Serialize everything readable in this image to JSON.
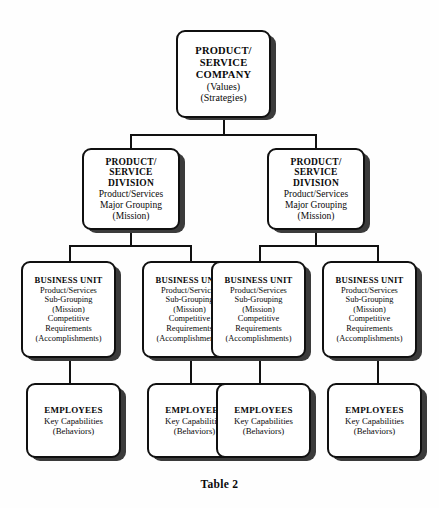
{
  "caption": "Table 2",
  "company": {
    "title_lines": [
      "PRODUCT/",
      "SERVICE",
      "COMPANY"
    ],
    "sub_lines": [
      "(Values)",
      "(Strategies)"
    ]
  },
  "divisions": [
    {
      "title_lines": [
        "PRODUCT/",
        "SERVICE",
        "DIVISION"
      ],
      "sub_lines": [
        "Product/Services",
        "Major Grouping",
        "(Mission)"
      ]
    },
    {
      "title_lines": [
        "PRODUCT/",
        "SERVICE",
        "DIVISION"
      ],
      "sub_lines": [
        "Product/Services",
        "Major Grouping",
        "(Mission)"
      ]
    }
  ],
  "business_units": [
    {
      "title_lines": [
        "BUSINESS UNIT"
      ],
      "sub_lines": [
        "Product/Services",
        "Sub-Grouping",
        "(Mission)",
        "Competitive",
        "Requirements",
        "(Accomplishments)"
      ]
    },
    {
      "title_lines": [
        "BUSINESS UNIT"
      ],
      "sub_lines": [
        "Product/Services",
        "Sub-Grouping",
        "(Mission)",
        "Competitive",
        "Requirements",
        "(Accomplishments)"
      ]
    },
    {
      "title_lines": [
        "BUSINESS UNIT"
      ],
      "sub_lines": [
        "Product/Services",
        "Sub-Grouping",
        "(Mission)",
        "Competitive",
        "Requirements",
        "(Accomplishments)"
      ]
    },
    {
      "title_lines": [
        "BUSINESS UNIT"
      ],
      "sub_lines": [
        "Product/Services",
        "Sub-Grouping",
        "(Mission)",
        "Competitive",
        "Requirements",
        "(Accomplishments)"
      ]
    }
  ],
  "employees": [
    {
      "title_lines": [
        "EMPLOYEES"
      ],
      "sub_lines": [
        "Key Capabilities",
        "(Behaviors)"
      ]
    },
    {
      "title_lines": [
        "EMPLOYEES"
      ],
      "sub_lines": [
        "Key Capabilities",
        "(Behaviors)"
      ]
    },
    {
      "title_lines": [
        "EMPLOYEES"
      ],
      "sub_lines": [
        "Key Capabilities",
        "(Behaviors)"
      ]
    },
    {
      "title_lines": [
        "EMPLOYEES"
      ],
      "sub_lines": [
        "Key Capabilities",
        "(Behaviors)"
      ]
    }
  ],
  "colors": {
    "border": "#101010",
    "shadow": "#3b3b3b",
    "line": "#111111",
    "background": "#fefefe"
  }
}
